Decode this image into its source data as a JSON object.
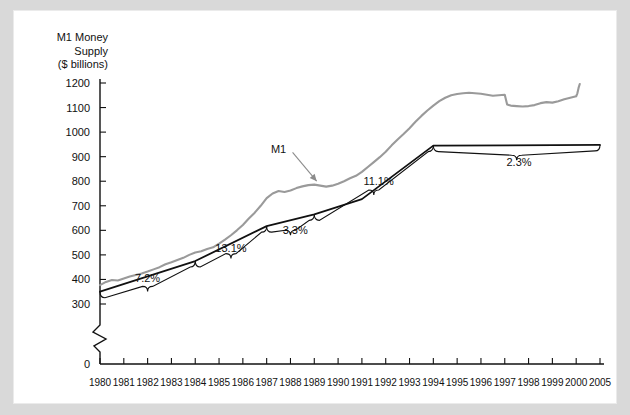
{
  "figure": {
    "title_lines": [
      "M1 Money",
      "Supply",
      "($ billions)"
    ],
    "background": "#d9d9d9",
    "panel_background": "#ffffff"
  },
  "chart_data": {
    "type": "line",
    "title": "M1 Money Supply ($ billions)",
    "xlabel": "",
    "ylabel": "M1 Money Supply ($ billions)",
    "ylim": [
      0,
      1200
    ],
    "yticks": [
      0,
      300,
      400,
      500,
      600,
      700,
      800,
      900,
      1000,
      1100,
      1200
    ],
    "y_axis_break_between": [
      0,
      300
    ],
    "xlim": [
      1980,
      2005
    ],
    "xticks": [
      1980,
      1981,
      1982,
      1983,
      1984,
      1985,
      1986,
      1987,
      1988,
      1989,
      1990,
      1991,
      1992,
      1993,
      1994,
      1995,
      1996,
      1997,
      1998,
      1999,
      2000,
      2005
    ],
    "grid": false,
    "legend_position": "inline-annotation",
    "series": [
      {
        "name": "M1",
        "color": "#9a9a9a",
        "style": "solid",
        "x": [
          1980.0,
          1980.25,
          1980.5,
          1980.75,
          1981.0,
          1981.25,
          1981.5,
          1981.75,
          1982.0,
          1982.25,
          1982.5,
          1982.75,
          1983.0,
          1983.25,
          1983.5,
          1983.75,
          1984.0,
          1984.25,
          1984.5,
          1984.75,
          1985.0,
          1985.25,
          1985.5,
          1985.75,
          1986.0,
          1986.25,
          1986.5,
          1986.75,
          1987.0,
          1987.25,
          1987.5,
          1987.75,
          1988.0,
          1988.25,
          1988.5,
          1988.75,
          1989.0,
          1989.25,
          1989.5,
          1989.75,
          1990.0,
          1990.25,
          1990.5,
          1990.75,
          1991.0,
          1991.25,
          1991.5,
          1991.75,
          1992.0,
          1992.25,
          1992.5,
          1992.75,
          1993.0,
          1993.25,
          1993.5,
          1993.75,
          1994.0,
          1994.25,
          1994.5,
          1994.75,
          1995.0,
          1995.25,
          1995.5,
          1995.75,
          1996.0,
          1996.25,
          1996.5,
          1996.75,
          1997.0,
          1997.1,
          1997.25,
          1997.5,
          1997.75,
          1998.0,
          1998.25,
          1998.5,
          1998.75,
          1999.0,
          1999.25,
          1999.5,
          1999.75,
          2000.0,
          2000.25,
          2000.5,
          2000.75
        ],
        "values": [
          377,
          390,
          398,
          396,
          404,
          412,
          418,
          424,
          432,
          441,
          450,
          462,
          470,
          479,
          488,
          500,
          510,
          515,
          524,
          531,
          546,
          562,
          580,
          600,
          622,
          648,
          672,
          700,
          731,
          750,
          760,
          756,
          762,
          772,
          779,
          784,
          786,
          782,
          778,
          782,
          790,
          800,
          812,
          822,
          838,
          858,
          878,
          898,
          920,
          946,
          970,
          992,
          1016,
          1042,
          1066,
          1088,
          1108,
          1126,
          1140,
          1150,
          1155,
          1158,
          1160,
          1158,
          1156,
          1152,
          1148,
          1150,
          1152,
          1112,
          1108,
          1106,
          1104,
          1106,
          1110,
          1118,
          1122,
          1120,
          1126,
          1134,
          1140,
          1146,
          1158,
          1180,
          1196
        ]
      },
      {
        "name": "Trend segments",
        "color": "#111111",
        "style": "solid",
        "x": [
          1980,
          1984,
          1987,
          1989,
          1991,
          1994,
          2005
        ],
        "values": [
          350,
          475,
          617,
          665,
          727,
          945,
          948
        ]
      }
    ],
    "annotations": [
      {
        "label": "M1",
        "kind": "series-pointer",
        "x": 1987.5,
        "y": 930,
        "points_to_x": 1989.1,
        "points_to_y": 800
      },
      {
        "label": "7.2%",
        "kind": "growth-rate",
        "segment": [
          1980,
          1984
        ],
        "x": 1982.0,
        "y": 405
      },
      {
        "label": "13.1%",
        "kind": "growth-rate",
        "segment": [
          1984,
          1987
        ],
        "x": 1985.5,
        "y": 530
      },
      {
        "label": "3.3%",
        "kind": "growth-rate",
        "segment": [
          1987,
          1989
        ],
        "x": 1988.2,
        "y": 600
      },
      {
        "label": "11.1%",
        "kind": "growth-rate",
        "segment": [
          1989,
          1994
        ],
        "x": 1991.7,
        "y": 800
      },
      {
        "label": "2.3%",
        "kind": "growth-rate",
        "segment": [
          1994,
          2005
        ],
        "x": 1997.6,
        "y": 880
      }
    ]
  }
}
